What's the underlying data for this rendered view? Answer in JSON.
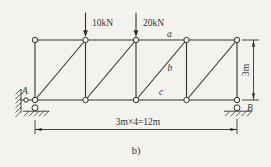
{
  "figure": {
    "caption": "b)",
    "loads": [
      {
        "label": "10kN"
      },
      {
        "label": "20kN"
      }
    ],
    "member_labels": {
      "top_chord": "a",
      "diagonal": "b",
      "bottom_chord": "c"
    },
    "supports": {
      "left_label": "A",
      "right_label": "B"
    },
    "dimensions": {
      "span": "3m×4=12m",
      "height": "3m"
    },
    "colors": {
      "ink": "#333330",
      "paper": "#f3f2ee"
    }
  }
}
